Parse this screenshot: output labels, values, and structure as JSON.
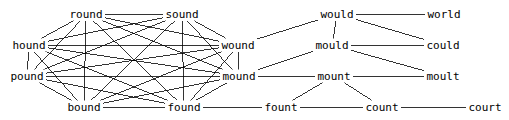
{
  "diagram": {
    "type": "word-network-graph",
    "title": "",
    "width": 509,
    "height": 120,
    "background_color": "#ffffff",
    "edge_color": "#000000",
    "text_color": "#000000",
    "nodes": [
      {
        "id": "round",
        "label": "round",
        "x": 86,
        "y": 14,
        "cluster": "ound"
      },
      {
        "id": "sound",
        "label": "sound",
        "x": 182,
        "y": 14,
        "cluster": "ound"
      },
      {
        "id": "hound",
        "label": "hound",
        "x": 29,
        "y": 45,
        "cluster": "ound"
      },
      {
        "id": "wound",
        "label": "wound",
        "x": 238,
        "y": 45,
        "cluster": "ound"
      },
      {
        "id": "pound",
        "label": "pound",
        "x": 27,
        "y": 76,
        "cluster": "ound"
      },
      {
        "id": "mound",
        "label": "mound",
        "x": 239,
        "y": 76,
        "cluster": "ound"
      },
      {
        "id": "bound",
        "label": "bound",
        "x": 84,
        "y": 107,
        "cluster": "ound"
      },
      {
        "id": "found",
        "label": "found",
        "x": 184,
        "y": 107,
        "cluster": "ound"
      },
      {
        "id": "would",
        "label": "would",
        "x": 337,
        "y": 14,
        "cluster": "ould"
      },
      {
        "id": "world",
        "label": "world",
        "x": 444,
        "y": 14,
        "cluster": "orld"
      },
      {
        "id": "mould",
        "label": "mould",
        "x": 332,
        "y": 45,
        "cluster": "ould"
      },
      {
        "id": "could",
        "label": "could",
        "x": 443,
        "y": 45,
        "cluster": "ould"
      },
      {
        "id": "mount",
        "label": "mount",
        "x": 334,
        "y": 76,
        "cluster": "ount"
      },
      {
        "id": "moult",
        "label": "moult",
        "x": 443,
        "y": 76,
        "cluster": "oult"
      },
      {
        "id": "fount",
        "label": "fount",
        "x": 281,
        "y": 107,
        "cluster": "ount"
      },
      {
        "id": "count",
        "label": "count",
        "x": 382,
        "y": 107,
        "cluster": "ount"
      },
      {
        "id": "court",
        "label": "court",
        "x": 485,
        "y": 107,
        "cluster": "ourt"
      }
    ],
    "edges": [
      {
        "from": "round",
        "to": "sound"
      },
      {
        "from": "round",
        "to": "hound"
      },
      {
        "from": "round",
        "to": "wound"
      },
      {
        "from": "round",
        "to": "pound"
      },
      {
        "from": "round",
        "to": "mound"
      },
      {
        "from": "round",
        "to": "bound"
      },
      {
        "from": "round",
        "to": "found"
      },
      {
        "from": "sound",
        "to": "hound"
      },
      {
        "from": "sound",
        "to": "wound"
      },
      {
        "from": "sound",
        "to": "pound"
      },
      {
        "from": "sound",
        "to": "mound"
      },
      {
        "from": "sound",
        "to": "bound"
      },
      {
        "from": "sound",
        "to": "found"
      },
      {
        "from": "hound",
        "to": "wound"
      },
      {
        "from": "hound",
        "to": "pound"
      },
      {
        "from": "hound",
        "to": "mound"
      },
      {
        "from": "hound",
        "to": "bound"
      },
      {
        "from": "hound",
        "to": "found"
      },
      {
        "from": "wound",
        "to": "pound"
      },
      {
        "from": "wound",
        "to": "mound"
      },
      {
        "from": "wound",
        "to": "bound"
      },
      {
        "from": "wound",
        "to": "found"
      },
      {
        "from": "pound",
        "to": "mound"
      },
      {
        "from": "pound",
        "to": "bound"
      },
      {
        "from": "pound",
        "to": "found"
      },
      {
        "from": "mound",
        "to": "bound"
      },
      {
        "from": "mound",
        "to": "found"
      },
      {
        "from": "bound",
        "to": "found"
      },
      {
        "from": "wound",
        "to": "would"
      },
      {
        "from": "mound",
        "to": "mould"
      },
      {
        "from": "mound",
        "to": "mount"
      },
      {
        "from": "found",
        "to": "fount"
      },
      {
        "from": "would",
        "to": "world"
      },
      {
        "from": "would",
        "to": "could"
      },
      {
        "from": "would",
        "to": "mould"
      },
      {
        "from": "mould",
        "to": "could"
      },
      {
        "from": "mould",
        "to": "moult"
      },
      {
        "from": "mount",
        "to": "moult"
      },
      {
        "from": "mount",
        "to": "fount"
      },
      {
        "from": "mount",
        "to": "count"
      },
      {
        "from": "fount",
        "to": "count"
      },
      {
        "from": "count",
        "to": "court"
      }
    ]
  }
}
